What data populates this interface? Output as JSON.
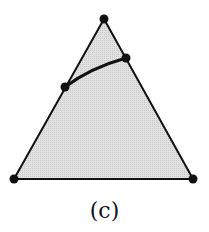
{
  "figure": {
    "caption": "(c)",
    "colors": {
      "fill": "#dcdcdc",
      "stroke": "#111111",
      "point": "#111111"
    },
    "triangle": {
      "vertices": [
        {
          "name": "top",
          "x": 104,
          "y": 19
        },
        {
          "name": "bottom-left",
          "x": 14,
          "y": 179
        },
        {
          "name": "bottom-right",
          "x": 193,
          "y": 179
        }
      ]
    },
    "curve": {
      "start": {
        "name": "left-edge-point",
        "x": 65,
        "y": 87
      },
      "end": {
        "name": "right-edge-point",
        "x": 126,
        "y": 58
      }
    }
  }
}
